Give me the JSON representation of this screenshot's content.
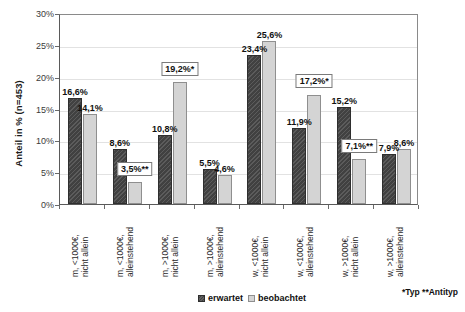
{
  "chart_data": {
    "type": "bar",
    "title": "",
    "xlabel": "",
    "ylabel": "Anteil in % (n=453)",
    "ylim": [
      0,
      30
    ],
    "ytick_labels": [
      "0%",
      "5%",
      "10%",
      "15%",
      "20%",
      "25%",
      "30%"
    ],
    "ytick_values": [
      0,
      5,
      10,
      15,
      20,
      25,
      30
    ],
    "grid": true,
    "legend_position": "bottom-center",
    "categories": [
      "m, <1000€, nicht allein",
      "m, <1000€, alleinstehend",
      "m, >1000€, nicht allein",
      "m, >1000€, alleinstehend",
      "w, <1000€, nicht allein",
      "w, <1000€, alleinstehend",
      "w, >1000€, nicht allein",
      "w, >1000€, alleinstehend"
    ],
    "category_lines": [
      [
        "m, <1000€,",
        "nicht allein"
      ],
      [
        "m, <1000€,",
        "alleinstehend"
      ],
      [
        "m, >1000€,",
        "nicht allein"
      ],
      [
        "m, >1000€,",
        "alleinstehend"
      ],
      [
        "w, <1000€,",
        "nicht allein"
      ],
      [
        "w, <1000€,",
        "alleinstehend"
      ],
      [
        "w, >1000€,",
        "nicht allein"
      ],
      [
        "w, >1000€,",
        "alleinstehend"
      ]
    ],
    "series": [
      {
        "name": "erwartet",
        "color": "#4a4a4a",
        "values": [
          16.6,
          8.6,
          10.8,
          5.5,
          23.4,
          11.9,
          15.2,
          7.9
        ],
        "labels": [
          "16,6%",
          "8,6%",
          "10,8%",
          "5,5%",
          "23,4%",
          "11,9%",
          "15,2%",
          "7,9%"
        ],
        "boxed": [
          false,
          false,
          false,
          false,
          false,
          false,
          false,
          false
        ]
      },
      {
        "name": "beobachtet",
        "color": "#d4d4d4",
        "values": [
          14.1,
          3.5,
          19.2,
          4.6,
          25.6,
          17.2,
          7.1,
          8.6
        ],
        "labels": [
          "14,1%",
          "3,5%**",
          "19,2%*",
          "4,6%",
          "25,6%",
          "17,2%*",
          "7,1%**",
          "8,6%"
        ],
        "boxed": [
          false,
          true,
          true,
          false,
          false,
          true,
          true,
          false
        ]
      }
    ],
    "annotations": {
      "footnote": "*Typ  **Antityp",
      "footnote_typ": "*Typ",
      "footnote_antityp": "**Antityp"
    }
  },
  "legend": {
    "items": [
      {
        "label": "erwartet",
        "style": "dark"
      },
      {
        "label": "beobachtet",
        "style": "light"
      }
    ]
  }
}
